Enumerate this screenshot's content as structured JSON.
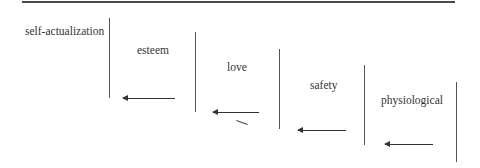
{
  "diagram": {
    "title": "",
    "levels": [
      {
        "label": "self-actualization"
      },
      {
        "label": "esteem"
      },
      {
        "label": "love"
      },
      {
        "label": "safety"
      },
      {
        "label": "physiological"
      }
    ],
    "colors": {
      "line": "#555555",
      "text": "#333333",
      "background": "#ffffff"
    }
  }
}
